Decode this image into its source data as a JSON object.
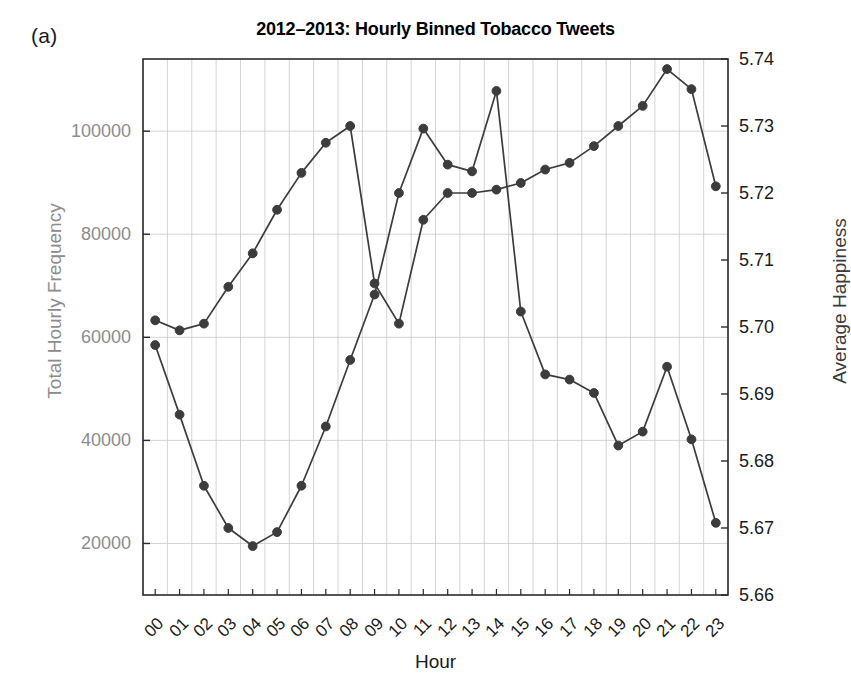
{
  "panel": {
    "label": "(a)"
  },
  "chart_data": {
    "type": "line",
    "title": "2012–2013: Hourly Binned Tobacco Tweets",
    "xlabel": "Hour",
    "ylabel": "Total Hourly Frequency",
    "ylabel_right": "Average Happiness",
    "grid": true,
    "legend": "none",
    "categories": [
      "00",
      "01",
      "02",
      "03",
      "04",
      "05",
      "06",
      "07",
      "08",
      "09",
      "10",
      "11",
      "12",
      "13",
      "14",
      "15",
      "16",
      "17",
      "18",
      "19",
      "20",
      "21",
      "22",
      "23"
    ],
    "ylim": [
      10000,
      114000
    ],
    "yticks": [
      "20000",
      "40000",
      "60000",
      "80000",
      "100000"
    ],
    "ytick_values": [
      20000,
      40000,
      60000,
      80000,
      100000
    ],
    "ylim_right": [
      5.66,
      5.74
    ],
    "yticks_right": [
      "5.66",
      "5.67",
      "5.68",
      "5.69",
      "5.70",
      "5.71",
      "5.72",
      "5.73",
      "5.74"
    ],
    "ytick_values_right": [
      5.66,
      5.67,
      5.68,
      5.69,
      5.7,
      5.71,
      5.72,
      5.73,
      5.74
    ],
    "series": [
      {
        "name": "Total Hourly Frequency",
        "axis": "left",
        "color": "#3c3c3c",
        "values": [
          58500,
          45000,
          31200,
          23000,
          19500,
          22200,
          31200,
          42700,
          55600,
          68300,
          88000,
          100500,
          93500,
          92200,
          107800,
          65000,
          52800,
          51800,
          49200,
          39000,
          41700,
          54300,
          40200,
          24000
        ]
      },
      {
        "name": "Average Happiness",
        "axis": "right",
        "color": "#3c3c3c",
        "values": [
          5.701,
          5.6995,
          5.7005,
          5.706,
          5.711,
          5.7175,
          5.723,
          5.7275,
          5.73,
          5.7065,
          5.7005,
          5.716,
          5.72,
          5.72,
          5.7205,
          5.7215,
          5.7235,
          5.7245,
          5.727,
          5.73,
          5.733,
          5.7385,
          5.7355,
          5.721
        ]
      }
    ],
    "note_series_mapping": "Two monotone-marker curves drawn in dark gray with filled circular markers; left curve is frequency (daily trough 04–05, peak 05 at 107800 in plotted order), right curve is happiness rising through the day peaking at hour 21."
  }
}
